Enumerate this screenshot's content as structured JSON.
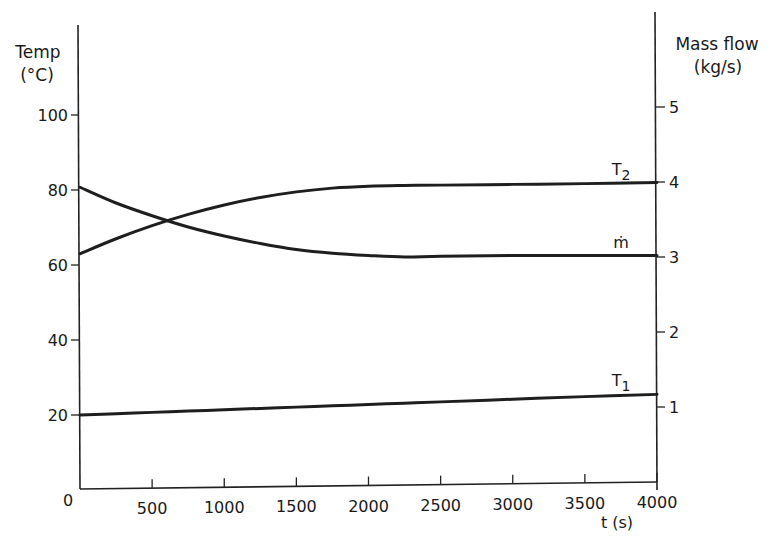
{
  "chart_data": {
    "type": "line",
    "title": "",
    "xlabel": "t (s)",
    "ylabel_left": "Temp (°C)",
    "ylabel_left_line1": "Temp",
    "ylabel_left_line2": "(°C)",
    "ylabel_right_line1": "Mass flow",
    "ylabel_right_line2": "(kg/s)",
    "xlim": [
      0,
      4000
    ],
    "ylim_left": [
      0,
      120
    ],
    "ylim_right": [
      0,
      6
    ],
    "grid": false,
    "legend": "inline labels at right end of curves",
    "x_ticks": [
      "0",
      "500",
      "1000",
      "1500",
      "2000",
      "2500",
      "3000",
      "3500",
      "4000"
    ],
    "y_left_ticks": [
      "20",
      "40",
      "60",
      "80",
      "100"
    ],
    "y_right_ticks": [
      "1",
      "2",
      "3",
      "4",
      "5"
    ],
    "x": [
      0,
      250,
      500,
      750,
      1000,
      1250,
      1500,
      1750,
      2000,
      2250,
      2500,
      3000,
      3500,
      4000
    ],
    "series": [
      {
        "name": "T2",
        "label": "T",
        "subscript": "2",
        "axis": "left",
        "values": [
          63,
          67,
          70.5,
          73.5,
          76,
          78,
          79.5,
          80.5,
          81,
          81.2,
          81.3,
          81.5,
          81.7,
          82
        ]
      },
      {
        "name": "ṁ",
        "label": "ṁ",
        "axis": "right",
        "values": [
          3.93,
          3.72,
          3.55,
          3.4,
          3.28,
          3.18,
          3.1,
          3.05,
          3.02,
          3.0,
          3.01,
          3.02,
          3.02,
          3.02
        ]
      },
      {
        "name": "T1",
        "label": "T",
        "subscript": "1",
        "axis": "left",
        "values": [
          20,
          20.35,
          20.7,
          21.05,
          21.4,
          21.75,
          22.1,
          22.45,
          22.8,
          23.15,
          23.5,
          24.2,
          24.9,
          25.5
        ]
      }
    ]
  }
}
